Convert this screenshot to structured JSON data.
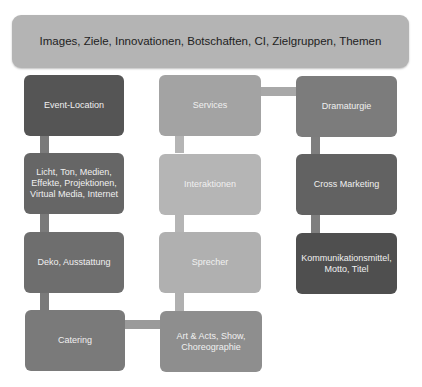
{
  "header": {
    "text": "Images, Ziele, Innovationen, Botschaften, CI, Zielgruppen, Themen"
  },
  "columns": [
    {
      "boxes": [
        {
          "label": "Event-Location",
          "color": "#555555"
        },
        {
          "label": "Licht, Ton, Medien, Effekte, Projektionen, Virtual Media, Internet",
          "color": "#666666"
        },
        {
          "label": "Deko, Ausstattung",
          "color": "#6e6e6e"
        },
        {
          "label": "Catering",
          "color": "#7a7a7a"
        }
      ]
    },
    {
      "boxes": [
        {
          "label": "Services",
          "color": "#a3a3a3"
        },
        {
          "label": "Interaktionen",
          "color": "#b5b5b5"
        },
        {
          "label": "Sprecher",
          "color": "#b0b0b0"
        },
        {
          "label": "Art & Acts, Show, Choreographie",
          "color": "#8e8e8e"
        }
      ]
    },
    {
      "boxes": [
        {
          "label": "Dramaturgie",
          "color": "#7c7c7c"
        },
        {
          "label": "Cross Marketing",
          "color": "#626262"
        },
        {
          "label": "Kommunikationsmittel, Motto, Titel",
          "color": "#4f4f4f"
        }
      ]
    }
  ],
  "connector_colors": {
    "col1": "#7a7a7a",
    "col2": "#b5b5b5",
    "col3": "#7e7e7e",
    "h_top": "#a8a8a8",
    "h_bottom": "#9a9a9a"
  }
}
